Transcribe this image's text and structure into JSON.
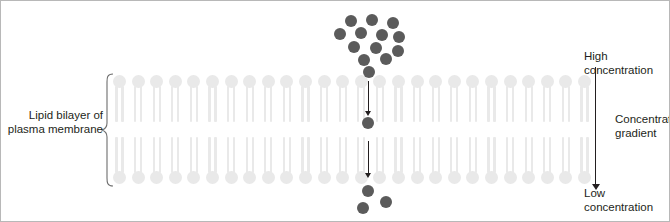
{
  "figure": {
    "frame_color": "#b8b8b8",
    "background": "#ffffff"
  },
  "labels": {
    "bilayer": "Lipid bilayer of\nplasma membrane",
    "high_concentration": "High concentration",
    "concentration_gradient": "Concentration\ngradient",
    "low_concentration": "Low concentration"
  },
  "colors": {
    "particle": "#5b5b5b",
    "phospholipid": "#e9e9e9",
    "text": "#231f20",
    "arrow": "#231f20"
  },
  "membrane": {
    "leaflets": 2,
    "lipids_per_leaflet": 26,
    "first_lipid_x": 112,
    "lipid_pitch": 18.6,
    "upper_leaflet_top": 74,
    "lower_leaflet_top": 136,
    "left_bracket_x": 100,
    "brace_label": "Lipid bilayer of plasma membrane"
  },
  "particles": {
    "above_membrane": [
      {
        "x": 344,
        "y": 14
      },
      {
        "x": 365,
        "y": 13
      },
      {
        "x": 386,
        "y": 16
      },
      {
        "x": 333,
        "y": 27
      },
      {
        "x": 354,
        "y": 26
      },
      {
        "x": 375,
        "y": 28
      },
      {
        "x": 392,
        "y": 30
      },
      {
        "x": 347,
        "y": 40
      },
      {
        "x": 369,
        "y": 41
      },
      {
        "x": 391,
        "y": 44
      },
      {
        "x": 357,
        "y": 53
      },
      {
        "x": 379,
        "y": 52
      },
      {
        "x": 362,
        "y": 65
      }
    ],
    "inside_membrane": [
      {
        "x": 361,
        "y": 116
      }
    ],
    "below_membrane": [
      {
        "x": 361,
        "y": 184
      },
      {
        "x": 379,
        "y": 195
      },
      {
        "x": 356,
        "y": 201
      }
    ]
  },
  "diffusion_arrows": [
    {
      "x": 367,
      "y_top": 80,
      "y_bottom": 110,
      "direction": "down"
    },
    {
      "x": 367,
      "y_top": 140,
      "y_bottom": 172,
      "direction": "down"
    }
  ],
  "gradient_arrow": {
    "x": 594,
    "y_top": 66,
    "y_bottom": 183,
    "direction": "down",
    "top_label": "High concentration",
    "bottom_label": "Low concentration",
    "side_label": "Concentration gradient"
  }
}
